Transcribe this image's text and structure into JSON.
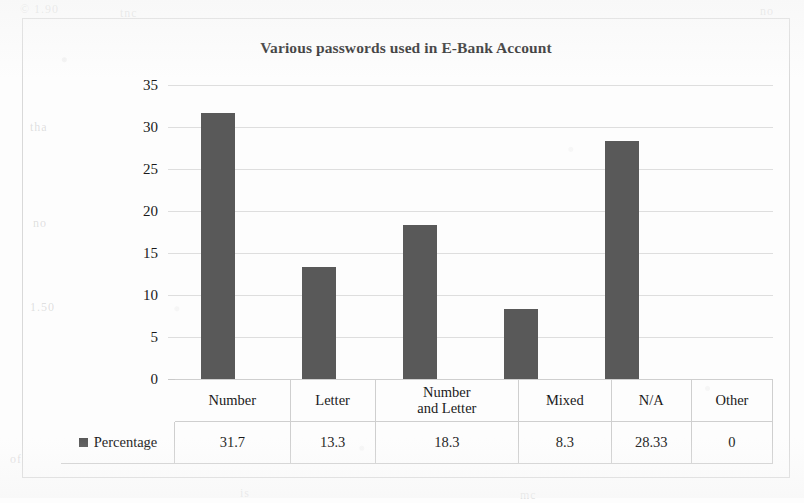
{
  "chart_data": {
    "type": "bar",
    "title": "Various passwords used in E-Bank Account",
    "xlabel": "",
    "ylabel": "",
    "categories": [
      "Number",
      "Letter",
      "Number and Letter",
      "Mixed",
      "N/A",
      "Other"
    ],
    "category_lines": [
      [
        "Number"
      ],
      [
        "Letter"
      ],
      [
        "Number",
        "and Letter"
      ],
      [
        "Mixed"
      ],
      [
        "N/A"
      ],
      [
        "Other"
      ]
    ],
    "series": [
      {
        "name": "Percentage",
        "values": [
          31.7,
          13.3,
          18.3,
          8.3,
          28.33,
          0
        ],
        "value_labels": [
          "31.7",
          "13.3",
          "18.3",
          "8.3",
          "28.33",
          "0"
        ],
        "color": "#595959"
      }
    ],
    "ylim": [
      0,
      35
    ],
    "y_ticks": [
      0,
      5,
      10,
      15,
      20,
      25,
      30,
      35
    ],
    "y_tick_labels": [
      "0",
      "5",
      "10",
      "15",
      "20",
      "25",
      "30",
      "35"
    ],
    "grid": true,
    "legend_position": "data-table-row",
    "data_table_visible": true
  },
  "table": {
    "legend_label": "Percentage",
    "legend_marker": "square-marker"
  },
  "colors": {
    "bar": "#595959",
    "gridline": "#dedede",
    "frame": "#d9d9d9",
    "text": "#1a1a1a"
  },
  "background_ghosts": [
    {
      "text": "© 1.90",
      "left": 20,
      "top": 2
    },
    {
      "text": "tnc",
      "left": 120,
      "top": 6
    },
    {
      "text": "no",
      "left": 760,
      "top": 4
    },
    {
      "text": "tha",
      "left": 30,
      "top": 120
    },
    {
      "text": "no",
      "left": 33,
      "top": 216
    },
    {
      "text": "1.50",
      "left": 30,
      "top": 300
    },
    {
      "text": "of",
      "left": 10,
      "top": 452
    },
    {
      "text": "is",
      "left": 240,
      "top": 486
    },
    {
      "text": "mc",
      "left": 520,
      "top": 488
    }
  ]
}
